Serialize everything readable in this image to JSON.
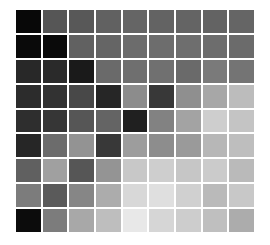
{
  "chart_data": {
    "type": "heatmap",
    "title": "",
    "subtitle": "",
    "xlabel": "",
    "ylabel": "",
    "grid": false,
    "legend": "none",
    "colormap": "grayscale",
    "background_color": "#ffffff",
    "cell_gap_px": 2,
    "rows": 9,
    "columns": 9,
    "x_tick_labels": [],
    "y_tick_labels": [],
    "annotations": [],
    "value_range": [
      0,
      255
    ],
    "value_description": "8-bit grayscale intensity per matrix cell; 0 = black, 255 = white",
    "values": [
      [
        8,
        86,
        88,
        97,
        101,
        99,
        100,
        99,
        101
      ],
      [
        10,
        10,
        97,
        101,
        108,
        109,
        110,
        109,
        107
      ],
      [
        40,
        42,
        26,
        106,
        111,
        112,
        106,
        122,
        116
      ],
      [
        44,
        50,
        72,
        38,
        140,
        56,
        143,
        167,
        188
      ],
      [
        46,
        54,
        86,
        100,
        32,
        130,
        163,
        206,
        196
      ],
      [
        38,
        108,
        147,
        56,
        157,
        141,
        154,
        183,
        190
      ],
      [
        96,
        160,
        86,
        148,
        200,
        206,
        198,
        203,
        186
      ],
      [
        124,
        90,
        134,
        172,
        216,
        223,
        208,
        186,
        200
      ],
      [
        12,
        124,
        168,
        190,
        232,
        214,
        205,
        191,
        172
      ]
    ],
    "cell_colors": [
      [
        "#080808",
        "#565656",
        "#585858",
        "#616161",
        "#656565",
        "#636363",
        "#646464",
        "#636363",
        "#656565"
      ],
      [
        "#0a0a0a",
        "#0a0a0a",
        "#616161",
        "#656565",
        "#6c6c6c",
        "#6d6d6d",
        "#6e6e6e",
        "#6d6d6d",
        "#6b6b6b"
      ],
      [
        "#282828",
        "#2a2a2a",
        "#1a1a1a",
        "#6a6a6a",
        "#6f6f6f",
        "#707070",
        "#6a6a6a",
        "#7a7a7a",
        "#747474"
      ],
      [
        "#2c2c2c",
        "#323232",
        "#484848",
        "#262626",
        "#8c8c8c",
        "#383838",
        "#8f8f8f",
        "#a7a7a7",
        "#bcbcbc"
      ],
      [
        "#2e2e2e",
        "#363636",
        "#565656",
        "#646464",
        "#202020",
        "#828282",
        "#a3a3a3",
        "#cecece",
        "#c4c4c4"
      ],
      [
        "#262626",
        "#6c6c6c",
        "#939393",
        "#383838",
        "#9d9d9d",
        "#8d8d8d",
        "#9a9a9a",
        "#b7b7b7",
        "#bebebe"
      ],
      [
        "#606060",
        "#a0a0a0",
        "#565656",
        "#949494",
        "#c8c8c8",
        "#cecece",
        "#c6c6c6",
        "#cbcbcb",
        "#bababa"
      ],
      [
        "#7c7c7c",
        "#5a5a5a",
        "#868686",
        "#acacac",
        "#d8d8d8",
        "#dfdfdf",
        "#d0d0d0",
        "#bababa",
        "#c8c8c8"
      ],
      [
        "#0c0c0c",
        "#7c7c7c",
        "#a8a8a8",
        "#bebebe",
        "#e8e8e8",
        "#d6d6d6",
        "#cdcdcd",
        "#bfbfbf",
        "#acacac"
      ]
    ]
  }
}
